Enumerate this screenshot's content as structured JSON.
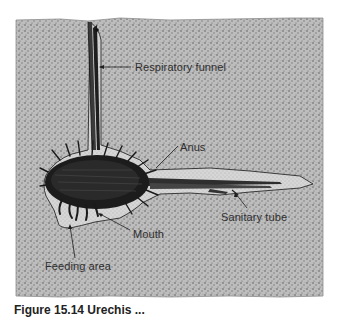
{
  "diagram": {
    "colors": {
      "sediment_fill": "#b9b9b9",
      "sediment_dots": "#6a6a6a",
      "burrow_fill": "#d2d2d2",
      "worm_body": "#1e1e1e",
      "outline": "#2a2a2a",
      "label_text": "#2e2e2e",
      "background": "#ffffff"
    },
    "labels": [
      {
        "id": "respiratory-funnel",
        "text": "Respiratory funnel",
        "x": 135,
        "y": 63
      },
      {
        "id": "anus",
        "text": "Anus",
        "x": 180,
        "y": 142
      },
      {
        "id": "sanitary-tube",
        "text": "Sanitary tube",
        "x": 221,
        "y": 212
      },
      {
        "id": "mouth",
        "text": "Mouth",
        "x": 133,
        "y": 229
      },
      {
        "id": "feeding-area",
        "text": "Feeding area",
        "x": 45,
        "y": 261
      }
    ]
  },
  "caption": {
    "text": "Figure 15.14 Urechis ...",
    "truncated": true
  }
}
